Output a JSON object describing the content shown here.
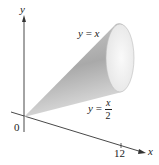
{
  "diagram": {
    "type": "solid-of-revolution",
    "axes": {
      "x_label": "x",
      "y_label": "y",
      "origin_label": "0",
      "x_tick_label": "12"
    },
    "curves": {
      "upper": {
        "lhs": "y",
        "eq": "=",
        "rhs": "x"
      },
      "lower": {
        "lhs": "y",
        "eq": "=",
        "num": "x",
        "den": "2"
      }
    },
    "colors": {
      "cone_light": "#f2f2f2",
      "cone_dark": "#9a9a9a",
      "axis": "#333333",
      "base_face": "#efefef"
    }
  }
}
